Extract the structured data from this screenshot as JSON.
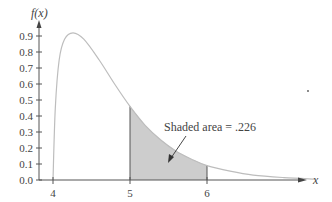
{
  "chart_data": {
    "type": "area",
    "title": "",
    "xlabel": "x",
    "ylabel": "f(x)",
    "x_ticks": [
      "4",
      "5",
      "6"
    ],
    "y_ticks": [
      "0.0",
      "0.1",
      "0.2",
      "0.3",
      "0.4",
      "0.5",
      "0.6",
      "0.7",
      "0.8",
      "0.9"
    ],
    "xlim": [
      3.8,
      7.4
    ],
    "ylim": [
      0,
      0.98
    ],
    "grid": false,
    "series": [
      {
        "name": "density f(x)",
        "x": [
          4.0,
          4.03,
          4.08,
          4.15,
          4.26,
          4.4,
          4.6,
          4.8,
          5.0,
          5.2,
          5.4,
          5.6,
          5.8,
          6.0,
          6.3,
          6.6,
          7.0,
          7.4
        ],
        "values": [
          0,
          0.45,
          0.75,
          0.88,
          0.92,
          0.88,
          0.75,
          0.6,
          0.46,
          0.34,
          0.25,
          0.18,
          0.13,
          0.09,
          0.055,
          0.03,
          0.015,
          0.006
        ]
      }
    ],
    "shaded_region": {
      "from": 5,
      "to": 6,
      "area": 0.226
    },
    "annotations": [
      {
        "text": "Shaded area = .226"
      }
    ]
  },
  "labels": {
    "y_axis": "f(x)",
    "x_axis": "x",
    "annotation": "Shaded area = .226"
  },
  "colors": {
    "curve": "#bdbdbd",
    "shade": "#cdcdcd",
    "axis": "#555555"
  }
}
